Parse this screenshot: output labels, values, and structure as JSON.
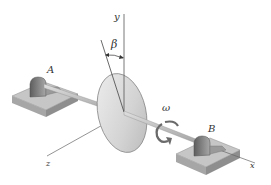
{
  "diagram": {
    "type": "rigid-body-dynamics",
    "labels": {
      "axis_y": "y",
      "axis_x": "x",
      "axis_z": "z",
      "angle": "β",
      "angular_velocity": "ω",
      "bearing_a": "A",
      "bearing_b": "B"
    },
    "colors": {
      "line": "#555555",
      "disk_fill": "#d6d6d6",
      "disk_edge": "#8a8a8a",
      "base_top": "#c9c9c9",
      "base_side": "#9a9a9a",
      "pillow_block": "#7a7a7a",
      "shaft": "#bdbdbd",
      "arrow": "#6a6a6a"
    }
  }
}
